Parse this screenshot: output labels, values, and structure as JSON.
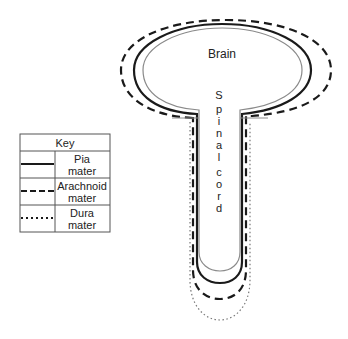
{
  "diagram": {
    "labels": {
      "brain": "Brain",
      "spinal_letters": [
        "S",
        "p",
        "i",
        "n",
        "a",
        "l"
      ],
      "cord_letters": [
        "c",
        "o",
        "r",
        "d"
      ]
    },
    "layers": [
      {
        "name": "inner-surface",
        "style": "thin-grey"
      },
      {
        "name": "Pia mater",
        "style": "solid"
      },
      {
        "name": "Arachnoid mater",
        "style": "dashed"
      },
      {
        "name": "Dura mater",
        "style": "dotted"
      }
    ]
  },
  "key": {
    "title": "Key",
    "rows": [
      {
        "line": "solid",
        "label_line1": "Pia",
        "label_line2": "mater"
      },
      {
        "line": "dashed",
        "label_line1": "Arachnoid",
        "label_line2": "mater"
      },
      {
        "line": "dotted",
        "label_line1": "Dura",
        "label_line2": "mater"
      }
    ]
  },
  "colors": {
    "line": "#1a1a1a",
    "inner": "#8a8a8a",
    "dura": "#777777",
    "table_border": "#555555"
  }
}
